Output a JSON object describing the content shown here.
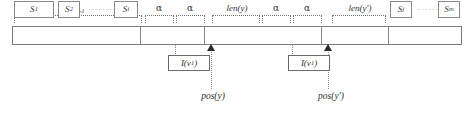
{
  "figure": {
    "cells": [
      {
        "id": "s1",
        "label": "S",
        "sub": "1"
      },
      {
        "id": "s2",
        "label": "S",
        "sub": "2"
      },
      {
        "id": "si",
        "label": "S",
        "sub": "i"
      },
      {
        "id": "sj",
        "label": "S",
        "sub": "j"
      },
      {
        "id": "sm",
        "label": "S",
        "sub": "m"
      }
    ],
    "ellipses": [
      {
        "id": "left-ellipsis",
        "text": "········"
      },
      {
        "id": "right-ellipsis",
        "text": "·······"
      }
    ],
    "brackets": [
      {
        "id": "n-i-1",
        "label": "N",
        "sub": "i-1",
        "greek": false
      },
      {
        "id": "alpha-1",
        "label": "α",
        "sub": "",
        "greek": true
      },
      {
        "id": "alpha-2",
        "label": "α",
        "sub": "",
        "greek": true
      },
      {
        "id": "len-y",
        "label": "len(y)",
        "sub": "",
        "greek": false
      },
      {
        "id": "alpha-3",
        "label": "α",
        "sub": "",
        "greek": true
      },
      {
        "id": "alpha-4",
        "label": "α",
        "sub": "",
        "greek": true
      },
      {
        "id": "len-y-prime",
        "label": "len(y′)",
        "sub": "",
        "greek": false
      }
    ],
    "callouts": [
      {
        "id": "callout-1",
        "label": "I(v",
        "sub": "1",
        "tail": ")"
      },
      {
        "id": "callout-2",
        "label": "I(v",
        "sub": "1",
        "tail": ")"
      }
    ],
    "positions": [
      {
        "id": "pos-y",
        "label": "pos(y)"
      },
      {
        "id": "pos-y-prime",
        "label": "pos(y′)"
      }
    ],
    "colors": {
      "stroke": "#7a7a7a",
      "text": "#2f2f2f",
      "arrow": "#2b2b2b",
      "dotted": "#8c8c8c",
      "background": "#ffffff"
    }
  }
}
